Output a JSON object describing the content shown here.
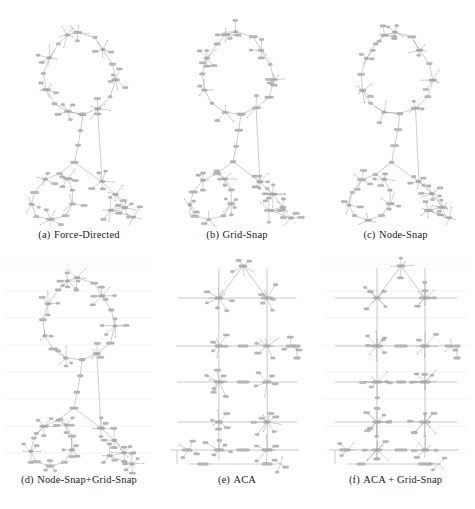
{
  "figure": {
    "type": "subfigure-grid",
    "columns": 3,
    "rows": 2,
    "background_color": "#ffffff",
    "node_color": "#b9b9b9",
    "node_stroke": "#8a8a8a",
    "edge_color": "#9a9a9a",
    "grid_line_color": "#e6e6e6",
    "caption_color": "#1a1a1a"
  },
  "panels": [
    {
      "id": "a",
      "label": "(a)",
      "title": "Force-Directed",
      "caption": "(a) Force-Directed",
      "show_grid": false,
      "style": "organic"
    },
    {
      "id": "b",
      "label": "(b)",
      "title": "Grid-Snap",
      "caption": "(b) Grid-Snap",
      "show_grid": false,
      "style": "organic"
    },
    {
      "id": "c",
      "label": "(c)",
      "title": "Node-Snap",
      "caption": "(c) Node-Snap",
      "show_grid": false,
      "style": "organic"
    },
    {
      "id": "d",
      "label": "(d)",
      "title": "Node-Snap+Grid-Snap",
      "caption": "(d) Node-Snap+Grid-Snap",
      "show_grid": true,
      "style": "organic"
    },
    {
      "id": "e",
      "label": "(e)",
      "title": "ACA",
      "caption": "(e) ACA",
      "show_grid": false,
      "style": "orthogonal"
    },
    {
      "id": "f",
      "label": "(f)",
      "title": "ACA + Grid-Snap",
      "caption": "(f) ACA + Grid-Snap",
      "show_grid": true,
      "style": "orthogonal"
    }
  ],
  "chart_data": {
    "type": "scatter",
    "title": "",
    "xlabel": "",
    "ylabel": "",
    "graphs": {
      "organic": {
        "description": "Large upper cycle joined by a vertical path to a lower cluster containing a second cycle; dense leaf fans on hub nodes.",
        "ring_top": [
          [
            79,
            28
          ],
          [
            96,
            33
          ],
          [
            104,
            46
          ],
          [
            113,
            60
          ],
          [
            117,
            76
          ],
          [
            112,
            93
          ],
          [
            99,
            104
          ],
          [
            84,
            110
          ],
          [
            68,
            108
          ],
          [
            55,
            99
          ],
          [
            47,
            86
          ],
          [
            45,
            70
          ],
          [
            50,
            54
          ],
          [
            60,
            40
          ],
          [
            69,
            31
          ]
        ],
        "spine": [
          [
            84,
            110
          ],
          [
            82,
            126
          ],
          [
            79,
            142
          ],
          [
            76,
            158
          ]
        ],
        "ring_bottom": [
          [
            60,
            170
          ],
          [
            46,
            176
          ],
          [
            36,
            188
          ],
          [
            33,
            201
          ],
          [
            38,
            212
          ],
          [
            52,
            216
          ],
          [
            66,
            212
          ],
          [
            74,
            200
          ],
          [
            74,
            186
          ],
          [
            68,
            175
          ]
        ],
        "hubs": [
          [
            79,
            28
          ],
          [
            113,
            60
          ],
          [
            47,
            86
          ],
          [
            84,
            110
          ],
          [
            76,
            158
          ],
          [
            52,
            216
          ],
          [
            108,
            192
          ],
          [
            123,
            205
          ]
        ]
      },
      "orthogonal": {
        "description": "Strongly axis-aligned layout: two long vertical trunks crossed by horizontal rails, with radial leaf fans at junction hubs.",
        "v_trunks_x": [
          56,
          104
        ],
        "h_rails_y": [
          48,
          96,
          132,
          172
        ],
        "hubs": [
          [
            56,
            60
          ],
          [
            104,
            60
          ],
          [
            56,
            96
          ],
          [
            104,
            96
          ],
          [
            56,
            132
          ],
          [
            104,
            132
          ],
          [
            56,
            172
          ],
          [
            104,
            172
          ],
          [
            80,
            22
          ]
        ]
      }
    }
  }
}
